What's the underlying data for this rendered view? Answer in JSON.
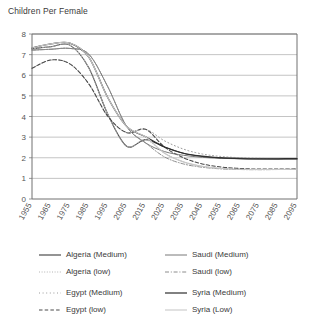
{
  "chart_data": {
    "type": "line",
    "title": "Children Per Female",
    "xlabel": "",
    "ylabel": "",
    "ylim": [
      0,
      8
    ],
    "yticks": [
      0,
      1,
      2,
      3,
      4,
      5,
      6,
      7,
      8
    ],
    "grid": true,
    "legend_position": "bottom",
    "x": [
      1955,
      1965,
      1975,
      1985,
      1995,
      2005,
      2015,
      2025,
      2035,
      2045,
      2055,
      2065,
      2075,
      2085,
      2095
    ],
    "xtick_labels": [
      "1955",
      "1965",
      "1975",
      "1985",
      "1995",
      "2005",
      "2015",
      "2025",
      "2035",
      "2045",
      "2055",
      "2065",
      "2075",
      "2085",
      "2095"
    ],
    "series": [
      {
        "name": "Algeria (Medium)",
        "style": "solid",
        "color": "#3c3c3c",
        "width": 1.1,
        "values": [
          7.28,
          7.38,
          7.46,
          6.36,
          4.12,
          2.56,
          2.88,
          2.52,
          2.22,
          2.08,
          2.0,
          1.97,
          1.95,
          1.94,
          1.94
        ]
      },
      {
        "name": "Algeria (low)",
        "style": "dotted-fine",
        "color": "#b4b4b4",
        "width": 1.0,
        "values": [
          7.28,
          7.38,
          7.46,
          6.36,
          4.12,
          2.56,
          2.88,
          2.22,
          1.8,
          1.58,
          1.48,
          1.44,
          1.43,
          1.43,
          1.44
        ]
      },
      {
        "name": "Egypt (Medium)",
        "style": "dotted-sparse",
        "color": "#9a9a9a",
        "width": 1.0,
        "values": [
          6.34,
          6.74,
          6.55,
          5.58,
          4.02,
          3.22,
          3.38,
          2.82,
          2.42,
          2.18,
          2.06,
          2.0,
          1.97,
          1.96,
          1.96
        ]
      },
      {
        "name": "Egypt (low)",
        "style": "dashed",
        "color": "#4a4a4a",
        "width": 1.1,
        "values": [
          6.34,
          6.74,
          6.55,
          5.58,
          4.02,
          3.22,
          3.38,
          2.52,
          2.0,
          1.7,
          1.55,
          1.48,
          1.45,
          1.45,
          1.46
        ]
      },
      {
        "name": "Saudi (Medium)",
        "style": "solid",
        "color": "#787878",
        "width": 1.0,
        "values": [
          7.22,
          7.26,
          7.3,
          7.02,
          5.45,
          3.52,
          2.72,
          2.3,
          2.12,
          2.02,
          1.97,
          1.95,
          1.94,
          1.94,
          1.95
        ]
      },
      {
        "name": "Saudi (low)",
        "style": "dashdot",
        "color": "#8c8c8c",
        "width": 1.0,
        "values": [
          7.22,
          7.26,
          7.3,
          7.02,
          5.45,
          3.52,
          2.72,
          2.04,
          1.7,
          1.54,
          1.46,
          1.43,
          1.42,
          1.43,
          1.44
        ]
      },
      {
        "name": "Syria (Medium)",
        "style": "solid",
        "color": "#2e2e2e",
        "width": 1.2,
        "values": [
          7.32,
          7.52,
          7.56,
          6.88,
          4.92,
          3.52,
          3.02,
          2.52,
          2.22,
          2.06,
          1.99,
          1.96,
          1.95,
          1.95,
          1.96
        ]
      },
      {
        "name": "Syria (Low)",
        "style": "solid-light",
        "color": "#c8c8c8",
        "width": 1.1,
        "values": [
          7.32,
          7.52,
          7.56,
          6.88,
          4.92,
          3.52,
          3.02,
          2.22,
          1.8,
          1.58,
          1.48,
          1.44,
          1.43,
          1.43,
          1.44
        ]
      }
    ]
  },
  "legend": {
    "left_column": [
      {
        "label": "Algeria (Medium)"
      },
      {
        "label": "Algeria (low)"
      },
      {
        "label": "Egypt (Medium)"
      },
      {
        "label": "Egypt (low)"
      }
    ],
    "right_column": [
      {
        "label": "Saudi (Medium)"
      },
      {
        "label": "Saudi (low)"
      },
      {
        "label": "Syria (Medium)"
      },
      {
        "label": "Syria (Low)"
      }
    ]
  },
  "colors": {
    "axis": "#808080",
    "grid": "#aaaaaa",
    "frame": "#707070",
    "text": "#3a3a3a"
  }
}
